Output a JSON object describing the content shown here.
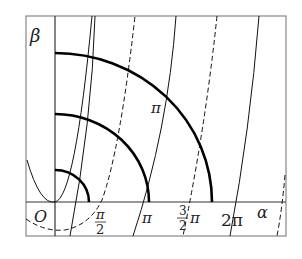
{
  "diagram": {
    "axes": {
      "x_label": "α",
      "y_label": "β",
      "origin_label": "O"
    },
    "tick_labels": [
      {
        "id": "half_pi",
        "numerator": "π",
        "denominator": "2"
      },
      {
        "id": "pi",
        "text": "π"
      },
      {
        "id": "three_half_pi",
        "numerator": "3",
        "denominator": "2",
        "suffix": "π"
      },
      {
        "id": "two_pi",
        "text": "2π"
      }
    ],
    "curve_labels": {
      "big_arc": "π"
    },
    "colors": {
      "line": "#111111",
      "frame": "#888888",
      "background": "#ffffff"
    }
  }
}
